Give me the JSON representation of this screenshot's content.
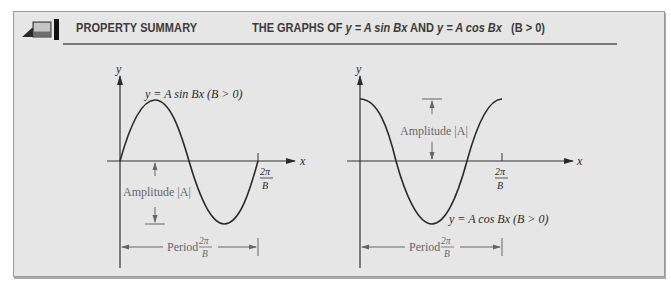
{
  "header": {
    "title": "PROPERTY SUMMARY",
    "subtitle_prefix": "THE GRAPHS OF",
    "eq1": "y = A sin Bx",
    "conj": "AND",
    "eq2": "y = A cos Bx",
    "condition": "(B > 0)"
  },
  "graphs": [
    {
      "name": "sine",
      "y_axis_label": "y",
      "x_axis_label": "x",
      "curve_label": "y = A sin Bx (B > 0)",
      "amplitude_label": "Amplitude |A|",
      "tick_label_num": "2π",
      "tick_label_den": "B",
      "period_label": "Period",
      "period_num": "2π",
      "period_den": "B"
    },
    {
      "name": "cosine",
      "y_axis_label": "y",
      "x_axis_label": "x",
      "curve_label": "y = A cos Bx (B > 0)",
      "amplitude_label": "Amplitude |A|",
      "tick_label_num": "2π",
      "tick_label_den": "B",
      "period_label": "Period",
      "period_num": "2π",
      "period_den": "B"
    }
  ],
  "colors": {
    "panel_bg": "#e6e6e6",
    "curve": "#2a2a2a",
    "annotation": "#666666",
    "header_text": "#3b3b3b"
  }
}
